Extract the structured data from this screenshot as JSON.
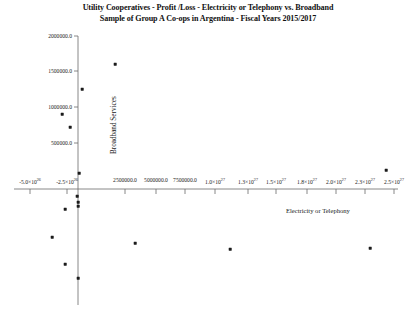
{
  "chart_data": {
    "type": "scatter",
    "title": "Utility Cooperatives - Profit /Loss - Electricity or Telephony vs. Broadband",
    "subtitle": "Sample of Group A Co-ops in Argentina - Fiscal Years 2015/2017",
    "xlabel": "Electricity or Telephony",
    "ylabel": "Broadband Services",
    "grid": false,
    "legend": "none",
    "xtick_labels": [
      "-5.0×10^26",
      "-2.5×10^26",
      "2500000.0",
      "5000000.0",
      "7500000.0",
      "1.0×10^27",
      "1.3×10^27",
      "1.5×10^27",
      "1.8×10^27",
      "2.0×10^27",
      "2.3×10^27",
      "2.5×10^27"
    ],
    "ytick_labels": [
      "2000000.0",
      "1500000.0",
      "1000000.0",
      "500000.0"
    ],
    "xtick_values": [
      -5e+26,
      -2.5e+26,
      2500000.0,
      5000000.0,
      7500000.0,
      1e+27,
      1.3e+27,
      1.5e+27,
      1.8e+27,
      2e+27,
      2.3e+27,
      2.5e+27
    ],
    "ytick_values": [
      2000000.0,
      1500000.0,
      1000000.0,
      500000.0
    ],
    "xlim": [
      -6.5e+26,
      2.7e+27
    ],
    "ylim": [
      -2600000.0,
      2150000.0
    ],
    "points": [
      {
        "x": -5e+26,
        "y": -900000,
        "px": 52,
        "py": 237
      },
      {
        "x": -4.3e+26,
        "y": -2050000,
        "px": 65,
        "py": 264
      },
      {
        "x": -2.6e+26,
        "y": -350000,
        "px": 65,
        "py": 209
      },
      {
        "x": -2.4e+26,
        "y": 1100000,
        "px": 62,
        "py": 114
      },
      {
        "x": -1.2e+26,
        "y": 880000,
        "px": 70,
        "py": 127
      },
      {
        "x": -2e+25,
        "y": -120000,
        "px": 77,
        "py": 196
      },
      {
        "x": -1e+25,
        "y": -210000,
        "px": 78,
        "py": 202
      },
      {
        "x": 0.0,
        "y": -380000,
        "px": 78,
        "py": 206
      },
      {
        "x": 0.0,
        "y": -2250000,
        "px": 78,
        "py": 278
      },
      {
        "x": 4e+25,
        "y": 300000,
        "px": 79,
        "py": 173
      },
      {
        "x": 1e+26,
        "y": 1250000,
        "px": 82,
        "py": 89
      },
      {
        "x": 3.2e+26,
        "y": 1750000,
        "px": 115,
        "py": 64
      },
      {
        "x": 6.6e+26,
        "y": -1050000,
        "px": 135,
        "py": 243
      },
      {
        "x": 1.4e+27,
        "y": -840000,
        "px": 230,
        "py": 249
      },
      {
        "x": 2.5e+27,
        "y": -820000,
        "px": 370,
        "py": 248
      },
      {
        "x": 2.5e+27,
        "y": 1150000,
        "px": 386,
        "py": 170
      }
    ],
    "xtick_px": [
      30,
      67,
      125,
      156,
      185,
      215,
      248,
      276,
      307,
      336,
      365,
      394
    ],
    "ytick_px": [
      36,
      71,
      107,
      143
    ],
    "axis_origin_px": {
      "x": 78,
      "y": 186
    },
    "yaxis_top_px": 36,
    "yaxis_bottom_px": 168,
    "xaxis_left_px": 14,
    "xaxis_right_px": 398,
    "colors": {
      "marker": "#1b1b1b",
      "axis": "#6b6b6b",
      "text": "#1a1a1a",
      "background": "#ffffff"
    }
  }
}
